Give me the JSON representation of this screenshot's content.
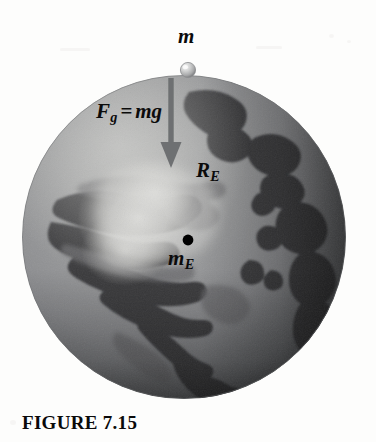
{
  "figure": {
    "caption": "FIGURE 7.15",
    "background_color": "#fdfdfc"
  },
  "diagram": {
    "labels": {
      "point_mass": "m",
      "force_symbol": "F",
      "force_subscript": "g",
      "force_equals": "=",
      "force_expression": "mg",
      "radius_symbol": "R",
      "radius_subscript": "E",
      "earth_mass_symbol": "m",
      "earth_mass_subscript": "E"
    },
    "colors": {
      "ocean": "#8f9093",
      "land": "#3c3d3f",
      "highlight": "#e7e7e4",
      "terminator": "#2a2b2d",
      "arrow": "#6f7073",
      "dashed_line": "#141414",
      "center_dot": "#000000",
      "surface_ball": "#b9babb"
    },
    "geometry": {
      "globe_center_x": 184,
      "globe_center_y": 237,
      "globe_radius": 163,
      "ball_center_x": 188,
      "ball_center_y": 70,
      "ball_radius": 7,
      "arrow_x": 171,
      "arrow_top_y": 78,
      "arrow_tip_y": 166,
      "dashed_x": 188,
      "dashed_top_y": 78,
      "dashed_bottom_y": 240,
      "center_dot_radius": 5
    }
  }
}
